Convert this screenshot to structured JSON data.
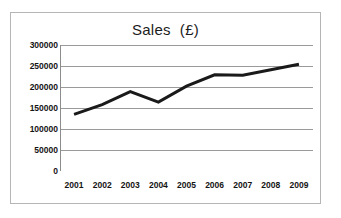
{
  "chart_data": {
    "type": "line",
    "title": "Sales  (£)",
    "xlabel": "",
    "ylabel": "",
    "categories": [
      "2001",
      "2002",
      "2003",
      "2004",
      "2005",
      "2006",
      "2007",
      "2008",
      "2009"
    ],
    "series": [
      {
        "name": "Sales",
        "values": [
          135000,
          158000,
          189000,
          164000,
          202000,
          229000,
          228000,
          241000,
          254000
        ],
        "color": "#1a1a1a",
        "line_width": 3
      }
    ],
    "ylim": [
      0,
      300000
    ],
    "yticks": [
      0,
      50000,
      100000,
      150000,
      200000,
      250000,
      300000
    ],
    "ytick_labels": [
      "0",
      "50000",
      "100000",
      "150000",
      "200000",
      "250000",
      "300000"
    ],
    "grid": {
      "horizontal": true,
      "vertical": false,
      "color": "#9a9a9a"
    },
    "legend": {
      "visible": false,
      "position": "none"
    },
    "axis_color": "#8c8c8c",
    "plot_background": "#ffffff",
    "border_color": "#b5b5b5"
  }
}
